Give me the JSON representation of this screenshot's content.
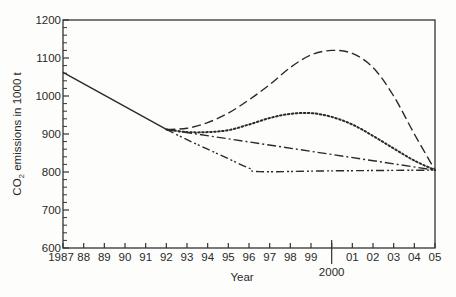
{
  "chart_data": {
    "type": "line",
    "title": "",
    "xlabel": "Year",
    "ylabel": "CO2 emissions in 1000 t",
    "ylabel_parts": {
      "pre": "CO",
      "sub": "2",
      "post": " emissions in 1000 t"
    },
    "xlim": [
      1987,
      2005
    ],
    "ylim": [
      600,
      1200
    ],
    "grid": false,
    "legend": "none",
    "y_ticks": [
      600,
      700,
      800,
      900,
      1000,
      1100,
      1200
    ],
    "x_ticks": [
      1987,
      1988,
      1989,
      1990,
      1991,
      1992,
      1993,
      1994,
      1995,
      1996,
      1997,
      1998,
      1999,
      2000,
      2001,
      2002,
      2003,
      2004,
      2005
    ],
    "x_tick_labels": [
      "1987",
      "88",
      "89",
      "90",
      "91",
      "92",
      "93",
      "94",
      "95",
      "96",
      "97",
      "98",
      "99",
      "",
      "01",
      "02",
      "03",
      "04",
      "05"
    ],
    "annotation": {
      "label": "2000",
      "x": 2000
    },
    "series": [
      {
        "name": "Historical (solid)",
        "style": "solid",
        "x": [
          1987,
          1992
        ],
        "y": [
          1062,
          912
        ]
      },
      {
        "name": "Scenario A (long dash)",
        "style": "longdash",
        "x": [
          1992,
          1993,
          1994,
          1995,
          1996,
          1997,
          1998,
          1999,
          2000,
          2001,
          2002,
          2003,
          2004,
          2005
        ],
        "y": [
          912,
          915,
          930,
          955,
          990,
          1030,
          1075,
          1108,
          1120,
          1112,
          1075,
          1000,
          900,
          805
        ]
      },
      {
        "name": "Scenario B (dotted)",
        "style": "dotted",
        "x": [
          1992,
          1993,
          1994,
          1995,
          1996,
          1997,
          1998,
          1999,
          2000,
          2001,
          2002,
          2003,
          2004,
          2005
        ],
        "y": [
          912,
          905,
          905,
          910,
          925,
          942,
          953,
          955,
          945,
          925,
          895,
          862,
          830,
          805
        ]
      },
      {
        "name": "Scenario C (dash-dot)",
        "style": "dashdot",
        "x": [
          1992,
          2005
        ],
        "y": [
          912,
          805
        ]
      },
      {
        "name": "Scenario D (dash-dot-dot)",
        "style": "dashdotdot",
        "x": [
          1992,
          1993,
          1994,
          1995,
          1996,
          1996.5,
          2000,
          2005
        ],
        "y": [
          912,
          885,
          860,
          835,
          810,
          801,
          803,
          805
        ]
      }
    ]
  }
}
